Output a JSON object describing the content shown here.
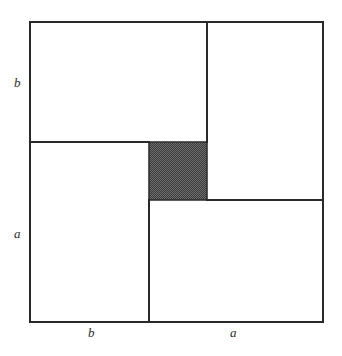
{
  "figure": {
    "background_color": "#ffffff",
    "stroke_color": "#2a2a2a",
    "stroke_width": 2,
    "shaded_fill_color": "#4f4f4f",
    "shaded_pattern": "dithered-checkerboard",
    "outer_square": {
      "x": 30,
      "y": 22,
      "width": 293,
      "height": 300,
      "side_label": "a + b"
    },
    "inner_shaded_square": {
      "x": 149,
      "y": 142,
      "width": 58,
      "height": 58,
      "side_label": "a - b"
    },
    "dividers": [
      {
        "name": "top-vertical",
        "orientation": "vertical",
        "x": 207,
        "y1": 22,
        "y2": 142
      },
      {
        "name": "left-horizontal",
        "orientation": "horizontal",
        "y": 142,
        "x1": 30,
        "x2": 149
      },
      {
        "name": "right-horizontal",
        "orientation": "horizontal",
        "y": 200,
        "x1": 207,
        "x2": 323
      },
      {
        "name": "bottom-vertical",
        "orientation": "vertical",
        "x": 149,
        "y1": 200,
        "y2": 322
      }
    ],
    "regions": [
      {
        "name": "top-left-rectangle",
        "fill": "none"
      },
      {
        "name": "top-right-rectangle",
        "fill": "none"
      },
      {
        "name": "bottom-left-rectangle",
        "fill": "none"
      },
      {
        "name": "bottom-right-rectangle",
        "fill": "none"
      },
      {
        "name": "center-square",
        "fill": "shaded"
      }
    ]
  },
  "labels": {
    "left_top": "b",
    "left_bottom": "a",
    "bottom_left": "b",
    "bottom_right": "a"
  }
}
